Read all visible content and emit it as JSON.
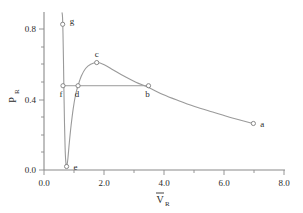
{
  "chart_data": {
    "type": "line",
    "title": "",
    "xlabel": "V̄_R",
    "ylabel": "P_R",
    "xlim": [
      0.0,
      8.0
    ],
    "ylim": [
      0.0,
      0.9
    ],
    "grid": false,
    "legend": "none",
    "xticks": [
      "0.0",
      "2.0",
      "4.0",
      "6.0",
      "8.0"
    ],
    "xtick_values": [
      0.0,
      2.0,
      4.0,
      6.0,
      8.0
    ],
    "yticks": [
      "0.0",
      "0.4",
      "0.8"
    ],
    "ytick_values": [
      0.0,
      0.4,
      0.8
    ],
    "y_minor_ticks": [
      0.1,
      0.2,
      0.3,
      0.5,
      0.6,
      0.7
    ],
    "x_minor_ticks": [
      1.0,
      3.0,
      5.0,
      7.0
    ],
    "series": [
      {
        "name": "isotherm",
        "x": [
          0.6,
          0.615,
          0.63,
          0.645,
          0.66,
          0.68,
          0.7,
          0.72,
          0.75,
          0.79,
          0.84,
          0.9,
          0.97,
          1.05,
          1.13,
          1.24,
          1.38,
          1.55,
          1.75,
          2.0,
          2.3,
          2.65,
          3.05,
          3.47,
          3.95,
          4.45,
          5.0,
          5.6,
          6.25,
          6.95
        ],
        "y": [
          0.895,
          0.87,
          0.78,
          0.64,
          0.47,
          0.27,
          0.13,
          0.055,
          0.02,
          0.06,
          0.155,
          0.255,
          0.35,
          0.43,
          0.48,
          0.535,
          0.578,
          0.602,
          0.612,
          0.6,
          0.57,
          0.535,
          0.5,
          0.47,
          0.43,
          0.396,
          0.362,
          0.33,
          0.296,
          0.265
        ]
      },
      {
        "name": "tie-line",
        "x": [
          0.63,
          1.13,
          3.47
        ],
        "y": [
          0.48,
          0.48,
          0.48
        ]
      }
    ],
    "points": [
      {
        "label": "a",
        "x": 6.95,
        "y": 0.265
      },
      {
        "label": "b",
        "x": 3.47,
        "y": 0.48
      },
      {
        "label": "c",
        "x": 1.75,
        "y": 0.612
      },
      {
        "label": "d",
        "x": 1.13,
        "y": 0.48
      },
      {
        "label": "e",
        "x": 0.75,
        "y": 0.02
      },
      {
        "label": "f",
        "x": 0.63,
        "y": 0.48
      },
      {
        "label": "g",
        "x": 0.62,
        "y": 0.83
      }
    ],
    "colors": {
      "curve": "#9a9a9a",
      "axis": "#8a8a8a",
      "marker_edge": "#7d7d7d",
      "marker_fill": "#ffffff",
      "text": "#2b2b2b",
      "background": "#ffffff"
    }
  },
  "axis_titles": {
    "y_main": "P",
    "y_sub": "R",
    "x_main": "V",
    "x_sub": "R"
  }
}
